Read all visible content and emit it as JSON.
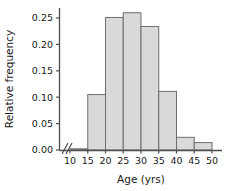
{
  "chart_data": {
    "type": "bar",
    "title": "",
    "subtitle": "",
    "xlabel": "Age (yrs)",
    "ylabel": "Relative frequency",
    "grid": false,
    "legend": null,
    "axis_break_x": true,
    "bin_edges": [
      10,
      15,
      20,
      25,
      30,
      35,
      40,
      45,
      50
    ],
    "categories": [
      "10-15",
      "15-20",
      "20-25",
      "25-30",
      "30-35",
      "35-40",
      "40-45",
      "45-50"
    ],
    "values": [
      0.002,
      0.105,
      0.251,
      0.26,
      0.234,
      0.111,
      0.024,
      0.014
    ],
    "xlim": [
      10,
      50
    ],
    "ylim": [
      0,
      0.27
    ],
    "xticks": [
      "10",
      "15",
      "20",
      "25",
      "30",
      "35",
      "40",
      "45",
      "50"
    ],
    "yticks": [
      "0.00",
      "0.05",
      "0.10",
      "0.15",
      "0.20",
      "0.25"
    ],
    "ytick_values": [
      0.0,
      0.05,
      0.1,
      0.15,
      0.2,
      0.25
    ],
    "bar_fill": "#d9d9d9",
    "bar_stroke": "#6e6e6e",
    "axis_color": "#4d4d4d",
    "text_color": "#1a1a1a"
  }
}
